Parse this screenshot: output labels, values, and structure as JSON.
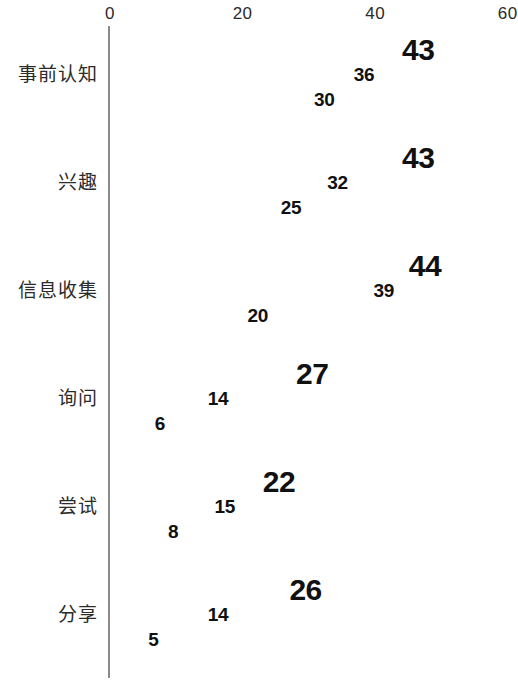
{
  "chart_data": {
    "type": "bar",
    "orientation": "horizontal",
    "title": "",
    "subtitle": "",
    "xlabel": "",
    "ylabel": "",
    "xlim": [
      0,
      60
    ],
    "grid": false,
    "legend": "none",
    "axis_ticks": [
      "0",
      "20",
      "40",
      "60"
    ],
    "axis_tick_values": [
      0,
      20,
      40,
      60
    ],
    "categories": [
      "事前认知",
      "兴趣",
      "信息收集",
      "询问",
      "尝试",
      "分享"
    ],
    "series": [
      {
        "name": "series-1",
        "color": "#1b92d6",
        "values": [
          43,
          43,
          44,
          27,
          22,
          26
        ]
      },
      {
        "name": "series-2",
        "color": "#68ab72",
        "values": [
          36,
          32,
          39,
          14,
          15,
          14
        ]
      },
      {
        "name": "series-3",
        "color": "#8dc63f",
        "values": [
          30,
          25,
          20,
          6,
          8,
          5
        ]
      }
    ],
    "data_labels": [
      [
        "43",
        "36",
        "30"
      ],
      [
        "43",
        "32",
        "25"
      ],
      [
        "44",
        "39",
        "20"
      ],
      [
        "27",
        "14",
        "6"
      ],
      [
        "22",
        "15",
        "8"
      ],
      [
        "26",
        "14",
        "5"
      ]
    ]
  },
  "colors": {
    "series_1": "#1b92d6",
    "series_2": "#68ab72",
    "series_3": "#8dc63f",
    "axis": "#8a8a8a",
    "text": "#1a1a1a",
    "background": "#ffffff"
  }
}
